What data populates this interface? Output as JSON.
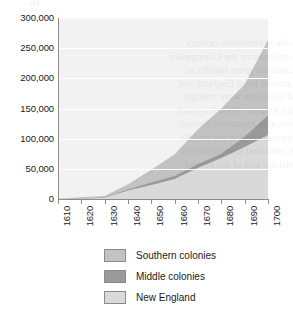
{
  "figure": {
    "partial_title": "(b)",
    "background": "#f2f2f2",
    "gridline_color": "#ffffff",
    "axis_color": "#8c8c8c"
  },
  "ghost_text": [
    "through the seventeenth century",
    "tobacco colonies of the Chesapeake",
    "of the Carolinas grew rapidly as",
    "settlers arrived from England and",
    "enslaved labourers were brought",
    "across the Atlantic. New England",
    "population also expanded through",
    "natural increase while the middle",
    "colonies remained comparatively",
    "small until the end of the period."
  ],
  "legend": {
    "position": "below-plot",
    "items": [
      {
        "label": "Southern colonies",
        "color": "#c2c2c2",
        "border": "#8a8a8a"
      },
      {
        "label": "Middle colonies",
        "color": "#9a9a9a",
        "border": "#8a8a8a"
      },
      {
        "label": "New England",
        "color": "#d9d9d9",
        "border": "#8a8a8a"
      }
    ]
  },
  "chart_data": {
    "type": "area",
    "stacked": true,
    "title": "",
    "subtitle": "",
    "xlabel": "",
    "ylabel": "",
    "grid": true,
    "xlim": [
      1610,
      1700
    ],
    "ylim": [
      0,
      300000
    ],
    "x": [
      1610,
      1620,
      1630,
      1640,
      1650,
      1660,
      1670,
      1680,
      1690,
      1700
    ],
    "xticklabels": [
      "1610",
      "1620",
      "1630",
      "1640",
      "1650",
      "1660",
      "1670",
      "1680",
      "1690",
      "1700"
    ],
    "yticks": [
      0,
      50000,
      100000,
      150000,
      200000,
      250000,
      300000
    ],
    "yticklabels": [
      "0",
      "50,000",
      "100,000",
      "150,000",
      "200,000",
      "250,000",
      "300,000"
    ],
    "series": [
      {
        "name": "New England",
        "color": "#d9d9d9",
        "stack_order": 1,
        "values": [
          0,
          500,
          2000,
          14000,
          23000,
          33000,
          52000,
          68000,
          86000,
          106000
        ]
      },
      {
        "name": "Middle colonies",
        "color": "#9a9a9a",
        "stack_order": 2,
        "values": [
          0,
          0,
          500,
          1900,
          4500,
          5100,
          5700,
          6800,
          17000,
          33000
        ]
      },
      {
        "name": "Southern colonies",
        "color": "#c2c2c2",
        "stack_order": 3,
        "values": [
          350,
          2300,
          2500,
          8500,
          21000,
          36000,
          58000,
          75000,
          87000,
          124000
        ]
      }
    ],
    "stacked_totals": [
      350,
      2800,
      5000,
      24400,
      48500,
      74100,
      115700,
      149800,
      190000,
      263000
    ]
  }
}
